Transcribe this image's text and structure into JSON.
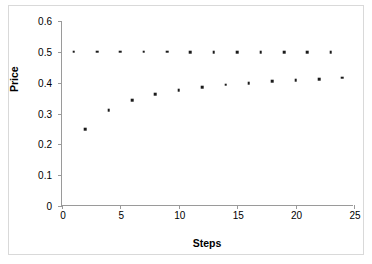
{
  "chart_data": {
    "type": "scatter",
    "title": "",
    "xlabel": "Steps",
    "ylabel": "Price",
    "xlim": [
      0,
      25
    ],
    "ylim": [
      0,
      0.6
    ],
    "xticks": [
      "0",
      "5",
      "10",
      "15",
      "20",
      "25"
    ],
    "xtick_values": [
      0,
      5,
      10,
      15,
      20,
      25
    ],
    "yticks": [
      "0",
      "0.1",
      "0.2",
      "0.3",
      "0.4",
      "0.5",
      "0.6"
    ],
    "ytick_values": [
      0,
      0.1,
      0.2,
      0.3,
      0.4,
      0.5,
      0.6
    ],
    "grid": false,
    "legend": null,
    "marker": "square",
    "marker_color": "#1b1b1b",
    "series": [
      {
        "name": "upper",
        "x": [
          1,
          3,
          5,
          7,
          9,
          11,
          13,
          15,
          17,
          19,
          21,
          23
        ],
        "values": [
          0.5,
          0.5,
          0.5,
          0.5,
          0.5,
          0.499,
          0.499,
          0.499,
          0.499,
          0.499,
          0.499,
          0.499
        ]
      },
      {
        "name": "lower",
        "x": [
          2,
          4,
          6,
          8,
          10,
          12,
          14,
          16,
          18,
          20,
          22,
          24
        ],
        "values": [
          0.249,
          0.311,
          0.343,
          0.362,
          0.376,
          0.385,
          0.393,
          0.399,
          0.404,
          0.408,
          0.412,
          0.416
        ]
      }
    ]
  }
}
